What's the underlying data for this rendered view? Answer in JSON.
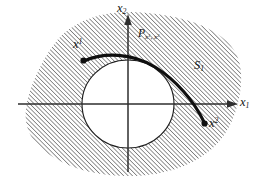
{
  "figure": {
    "kind": "mathematical-diagram",
    "background_color": "#ffffff",
    "ink_color": "#141414",
    "hatch_color": "#555555",
    "axis_color": "#3a3a3a",
    "labels": {
      "axis_horizontal": "x",
      "axis_horizontal_sub": "1",
      "axis_vertical": "x",
      "axis_vertical_sub": "2",
      "point_start": "x",
      "point_start_sup": "1",
      "point_end": "x",
      "point_end_sup": "2",
      "path_name": "P",
      "path_sub_first": "x",
      "path_sub_first_sup": "1",
      "path_sub_sep": ", ",
      "path_sub_second": "x",
      "path_sub_second_sup": "2",
      "region_name": "S",
      "region_sub": "1"
    },
    "geometry": {
      "origin_x": 128,
      "origin_y": 104,
      "hole_radius_x": 46,
      "hole_radius_y": 44,
      "start_point_x": 83,
      "start_point_y": 60,
      "end_point_x": 205,
      "end_point_y": 125,
      "hatch_angle_degrees": 45,
      "hatch_spacing_px": 3
    }
  }
}
